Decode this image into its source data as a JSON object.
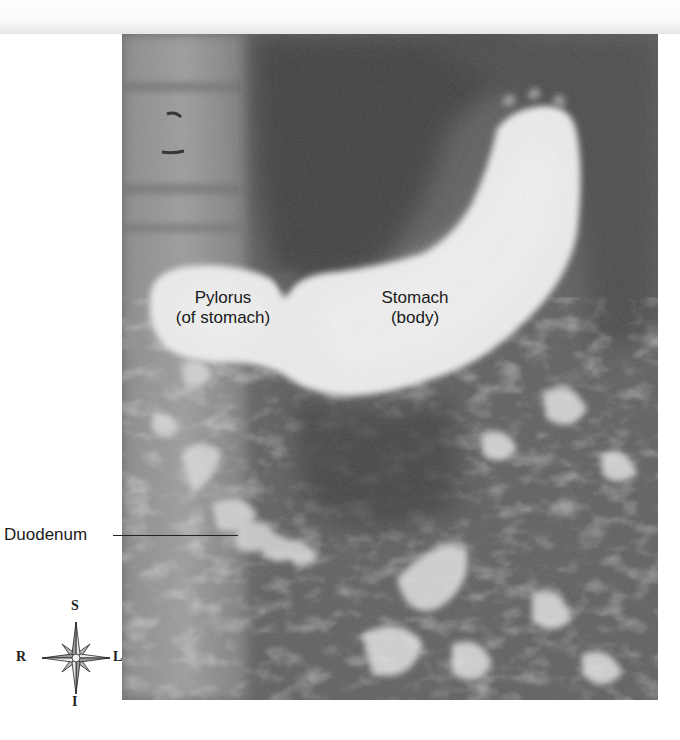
{
  "figure": {
    "type": "radiograph",
    "labels": {
      "pylorus_line1": "Pylorus",
      "pylorus_line2": "(of stomach)",
      "stomach_line1": "Stomach",
      "stomach_line2": "(body)",
      "duodenum": "Duodenum"
    },
    "compass": {
      "superior": "S",
      "inferior": "I",
      "right": "R",
      "left": "L"
    },
    "colors": {
      "background": "#ffffff",
      "barium_fill": "#ececec",
      "soft_tissue": "#5e5e5e",
      "dark_gas": "#3e3e3e",
      "label_text": "#1a1a1a"
    }
  }
}
